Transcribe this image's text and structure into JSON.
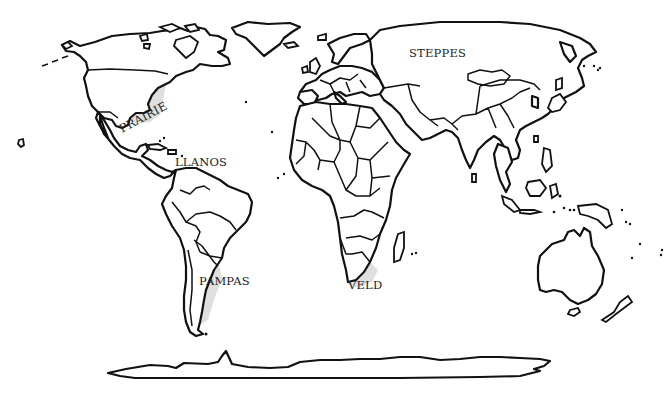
{
  "map": {
    "title": "World grasslands",
    "caption_clipped": "",
    "regions": [
      {
        "id": "prairie",
        "label": "PRAIRIE",
        "continent": "North America",
        "x": 122,
        "y": 133,
        "rotate": -28
      },
      {
        "id": "steppes",
        "label": "STEPPES",
        "continent": "Eurasia",
        "x": 409,
        "y": 57,
        "rotate": 0
      },
      {
        "id": "llanos",
        "label": "LLANOS",
        "continent": "South America",
        "x": 175,
        "y": 166,
        "rotate": 0
      },
      {
        "id": "pampas",
        "label": "PAMPAS",
        "continent": "South America",
        "x": 199,
        "y": 285,
        "rotate": 0
      },
      {
        "id": "veld",
        "label": "VELD",
        "continent": "Africa",
        "x": 348,
        "y": 289,
        "rotate": 0
      }
    ],
    "colors": {
      "outline": "#111111",
      "grassland_fill": "#d9d9d9",
      "background": "#ffffff",
      "label": "#222222"
    }
  }
}
